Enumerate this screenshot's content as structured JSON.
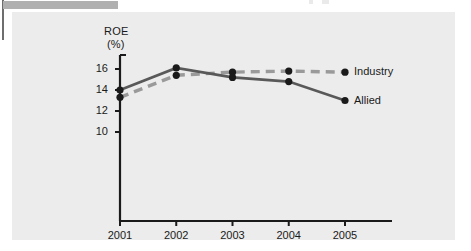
{
  "page": {
    "header_bar": "redaction-bar",
    "background_color": "#ffffff",
    "panel_color": "#ececec"
  },
  "chart_data": {
    "type": "line",
    "title": "",
    "subtitle": "",
    "xlabel": "",
    "ylabel": "ROE",
    "ylabel_units": "(%)",
    "categories": [
      "2001",
      "2002",
      "2003",
      "2004",
      "2005"
    ],
    "x": [
      2001,
      2002,
      2003,
      2004,
      2005
    ],
    "yticks": [
      10,
      12,
      14,
      16
    ],
    "ytick_labels": [
      "10",
      "12",
      "14",
      "16"
    ],
    "ylim": [
      9.2,
      16.6
    ],
    "xlim": [
      2000.75,
      2005.75
    ],
    "grid": false,
    "legend_position": "right-inline-at-last-point",
    "series": [
      {
        "name": "Industry",
        "values": [
          13.3,
          15.4,
          15.7,
          15.8,
          15.7
        ],
        "style": "dashed",
        "color": "#9a9a9a",
        "marker": "circle",
        "marker_color": "#1a1a1a"
      },
      {
        "name": "Allied",
        "values": [
          14.0,
          16.1,
          15.2,
          14.8,
          13.0
        ],
        "style": "solid",
        "color": "#595959",
        "marker": "circle",
        "marker_color": "#1a1a1a"
      }
    ],
    "colors": {
      "industry": "#9a9a9a",
      "allied": "#595959",
      "axis": "#1a1a1a",
      "marker": "#1a1a1a"
    }
  }
}
